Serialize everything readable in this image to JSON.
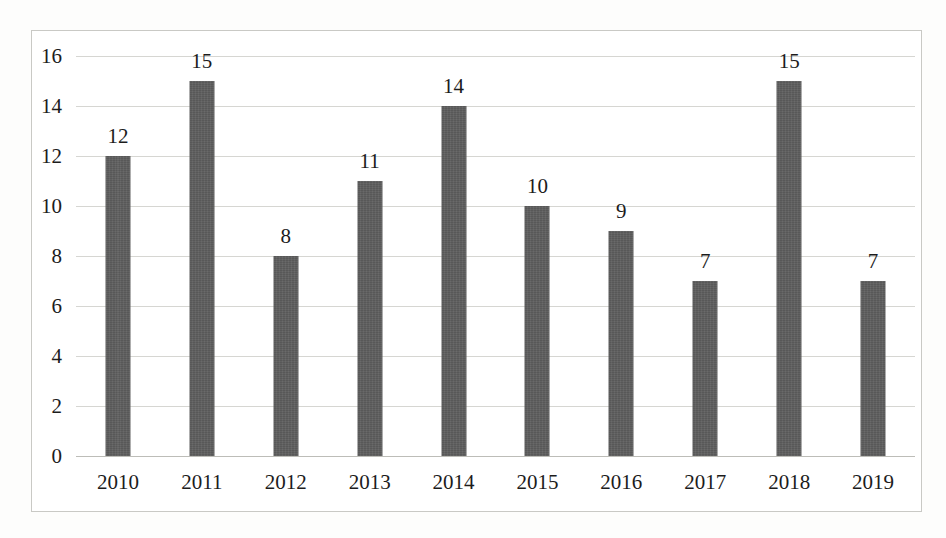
{
  "chart_data": {
    "type": "bar",
    "title": "",
    "subtitle": "",
    "xlabel": "",
    "ylabel": "",
    "categories": [
      "2010",
      "2011",
      "2012",
      "2013",
      "2014",
      "2015",
      "2016",
      "2017",
      "2018",
      "2019"
    ],
    "values": [
      12,
      15,
      8,
      11,
      14,
      10,
      9,
      7,
      15,
      7
    ],
    "data_labels": [
      "12",
      "15",
      "8",
      "11",
      "14",
      "10",
      "9",
      "7",
      "15",
      "7"
    ],
    "ylim": [
      0,
      16
    ],
    "ytick_labels": [
      "16",
      "14",
      "12",
      "10",
      "8",
      "6",
      "4",
      "2",
      "0"
    ],
    "ytick_values": [
      16,
      14,
      12,
      10,
      8,
      6,
      4,
      2,
      0
    ],
    "grid": true,
    "legend": null,
    "legend_position": "none",
    "series": [
      {
        "name": "",
        "values": [
          12,
          15,
          8,
          11,
          14,
          10,
          9,
          7,
          15,
          7
        ]
      }
    ],
    "colors": {
      "bar": "#585858",
      "gridline": "#d6d6d2",
      "axis": "#bdbdb8",
      "text": "#1c1c1c",
      "frame": "#c9c9c5",
      "background": "#ffffff"
    }
  }
}
